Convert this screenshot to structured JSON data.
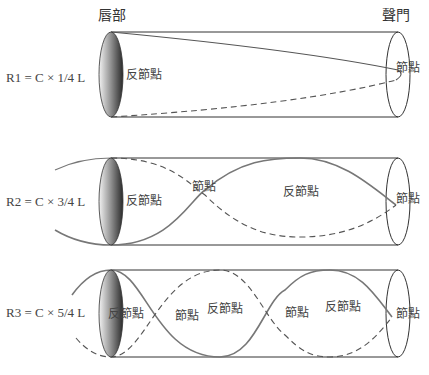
{
  "headers": {
    "lips": "唇部",
    "glottis": "聲門"
  },
  "rows": [
    {
      "equation": "R1 = C × 1/4 L",
      "labels": [
        {
          "text": "反節點",
          "x": 126,
          "y": 79
        },
        {
          "text": "節點",
          "x": 396,
          "y": 72
        }
      ]
    },
    {
      "equation": "R2 = C × 3/4 L",
      "labels": [
        {
          "text": "反節點",
          "x": 126,
          "y": 205
        },
        {
          "text": "節點",
          "x": 192,
          "y": 191
        },
        {
          "text": "反節點",
          "x": 283,
          "y": 196
        },
        {
          "text": "節點",
          "x": 396,
          "y": 203
        }
      ]
    },
    {
      "equation": "R3 = C × 5/4 L",
      "labels": [
        {
          "text": "反節點",
          "x": 108,
          "y": 318
        },
        {
          "text": "節點",
          "x": 175,
          "y": 320
        },
        {
          "text": "反節點",
          "x": 207,
          "y": 313
        },
        {
          "text": "節點",
          "x": 285,
          "y": 317
        },
        {
          "text": "反節點",
          "x": 325,
          "y": 311
        },
        {
          "text": "節點",
          "x": 396,
          "y": 318
        }
      ]
    }
  ],
  "colors": {
    "outline": "#333333",
    "wave": "#777777",
    "text": "#444444"
  }
}
